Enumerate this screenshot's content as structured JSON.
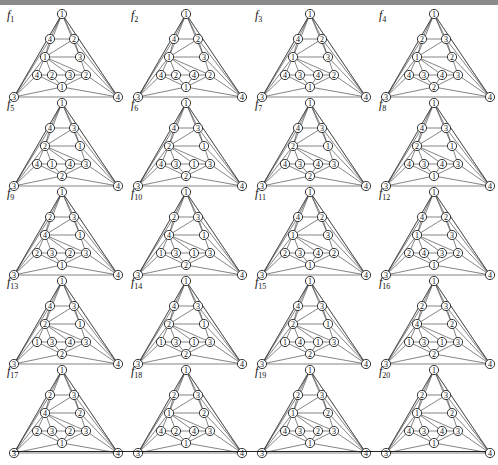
{
  "figure": {
    "layout": {
      "rows": 5,
      "cols": 4
    },
    "node_positions": {
      "top": [
        62,
        9
      ],
      "a": [
        50,
        34
      ],
      "b": [
        74,
        34
      ],
      "c": [
        45,
        52
      ],
      "d": [
        80,
        52
      ],
      "e": [
        37,
        70
      ],
      "f": [
        52,
        70
      ],
      "g": [
        70,
        70
      ],
      "h": [
        86,
        70
      ],
      "i": [
        62,
        82
      ],
      "left": [
        14,
        92
      ],
      "right": [
        118,
        92
      ]
    },
    "panels": [
      {
        "name": "f",
        "sub": "1",
        "labels": {
          "top": "1",
          "a": "4",
          "b": "2",
          "c": "1",
          "d": "3",
          "e": "4",
          "f": "2",
          "g": "3",
          "h": "2",
          "i": "1",
          "left": "3",
          "right": "4"
        }
      },
      {
        "name": "f",
        "sub": "2",
        "labels": {
          "top": "1",
          "a": "4",
          "b": "2",
          "c": "1",
          "d": "3",
          "e": "4",
          "f": "2",
          "g": "4",
          "h": "2",
          "i": "1",
          "left": "3",
          "right": "4"
        }
      },
      {
        "name": "f",
        "sub": "3",
        "labels": {
          "top": "1",
          "a": "4",
          "b": "2",
          "c": "1",
          "d": "3",
          "e": "4",
          "f": "3",
          "g": "4",
          "h": "2",
          "i": "1",
          "left": "3",
          "right": "4"
        }
      },
      {
        "name": "f",
        "sub": "4",
        "labels": {
          "top": "1",
          "a": "2",
          "b": "3",
          "c": "1",
          "d": "2",
          "e": "4",
          "f": "3",
          "g": "4",
          "h": "3",
          "i": "2",
          "left": "3",
          "right": "4"
        }
      },
      {
        "name": "f",
        "sub": "5",
        "labels": {
          "top": "1",
          "a": "4",
          "b": "3",
          "c": "2",
          "d": "1",
          "e": "4",
          "f": "1",
          "g": "4",
          "h": "3",
          "i": "2",
          "left": "3",
          "right": "4"
        }
      },
      {
        "name": "f",
        "sub": "6",
        "labels": {
          "top": "1",
          "a": "4",
          "b": "3",
          "c": "2",
          "d": "1",
          "e": "4",
          "f": "3",
          "g": "1",
          "h": "3",
          "i": "2",
          "left": "3",
          "right": "4"
        }
      },
      {
        "name": "f",
        "sub": "7",
        "labels": {
          "top": "1",
          "a": "4",
          "b": "3",
          "c": "2",
          "d": "1",
          "e": "4",
          "f": "3",
          "g": "4",
          "h": "3",
          "i": "2",
          "left": "3",
          "right": "4"
        }
      },
      {
        "name": "f",
        "sub": "8",
        "labels": {
          "top": "1",
          "a": "4",
          "b": "3",
          "c": "2",
          "d": "1",
          "e": "4",
          "f": "3",
          "g": "4",
          "h": "3",
          "i": "1",
          "left": "3",
          "right": "4"
        }
      },
      {
        "name": "f",
        "sub": "9",
        "labels": {
          "top": "1",
          "a": "2",
          "b": "3",
          "c": "4",
          "d": "1",
          "e": "2",
          "f": "3",
          "g": "2",
          "h": "3",
          "i": "1",
          "left": "3",
          "right": "4"
        }
      },
      {
        "name": "f",
        "sub": "10",
        "labels": {
          "top": "1",
          "a": "2",
          "b": "3",
          "c": "4",
          "d": "1",
          "e": "1",
          "f": "3",
          "g": "1",
          "h": "3",
          "i": "2",
          "left": "3",
          "right": "4"
        }
      },
      {
        "name": "f",
        "sub": "11",
        "labels": {
          "top": "1",
          "a": "4",
          "b": "2",
          "c": "1",
          "d": "3",
          "e": "2",
          "f": "3",
          "g": "4",
          "h": "2",
          "i": "1",
          "left": "3",
          "right": "4"
        }
      },
      {
        "name": "f",
        "sub": "12",
        "labels": {
          "top": "1",
          "a": "4",
          "b": "2",
          "c": "1",
          "d": "3",
          "e": "2",
          "f": "4",
          "g": "3",
          "h": "2",
          "i": "1",
          "left": "3",
          "right": "4"
        }
      },
      {
        "name": "f",
        "sub": "13",
        "labels": {
          "top": "1",
          "a": "4",
          "b": "3",
          "c": "2",
          "d": "1",
          "e": "1",
          "f": "3",
          "g": "4",
          "h": "3",
          "i": "2",
          "left": "3",
          "right": "4"
        }
      },
      {
        "name": "f",
        "sub": "14",
        "labels": {
          "top": "1",
          "a": "4",
          "b": "3",
          "c": "2",
          "d": "1",
          "e": "1",
          "f": "3",
          "g": "1",
          "h": "3",
          "i": "2",
          "left": "3",
          "right": "4"
        }
      },
      {
        "name": "f",
        "sub": "15",
        "labels": {
          "top": "1",
          "a": "4",
          "b": "3",
          "c": "2",
          "d": "1",
          "e": "1",
          "f": "4",
          "g": "1",
          "h": "3",
          "i": "2",
          "left": "3",
          "right": "4"
        }
      },
      {
        "name": "f",
        "sub": "16",
        "labels": {
          "top": "1",
          "a": "2",
          "b": "3",
          "c": "4",
          "d": "2",
          "e": "1",
          "f": "3",
          "g": "1",
          "h": "3",
          "i": "2",
          "left": "3",
          "right": "4"
        }
      },
      {
        "name": "f",
        "sub": "17",
        "labels": {
          "top": "1",
          "a": "2",
          "b": "3",
          "c": "4",
          "d": "2",
          "e": "2",
          "f": "3",
          "g": "2",
          "h": "3",
          "i": "1",
          "left": "3",
          "right": "4"
        }
      },
      {
        "name": "f",
        "sub": "18",
        "labels": {
          "top": "1",
          "a": "2",
          "b": "3",
          "c": "1",
          "d": "2",
          "e": "4",
          "f": "2",
          "g": "4",
          "h": "3",
          "i": "1",
          "left": "3",
          "right": "4"
        }
      },
      {
        "name": "f",
        "sub": "19",
        "labels": {
          "top": "1",
          "a": "2",
          "b": "3",
          "c": "1",
          "d": "2",
          "e": "4",
          "f": "3",
          "g": "2",
          "h": "3",
          "i": "1",
          "left": "3",
          "right": "4"
        }
      },
      {
        "name": "f",
        "sub": "20",
        "labels": {
          "top": "1",
          "a": "2",
          "b": "3",
          "c": "1",
          "d": "2",
          "e": "4",
          "f": "3",
          "g": "4",
          "h": "3",
          "i": "1",
          "left": "3",
          "right": "4"
        }
      }
    ]
  }
}
